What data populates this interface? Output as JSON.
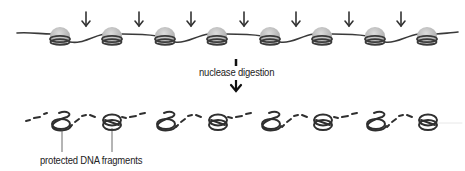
{
  "diagram": {
    "top_row": {
      "description": "chromatin fiber: DNA wrapped around nucleosomes",
      "nucleosome_count": 8,
      "nucleosome_x": [
        60,
        112,
        165,
        217,
        270,
        322,
        375,
        427
      ],
      "cut_arrow_x": [
        86,
        139,
        191,
        244,
        296,
        349,
        401
      ],
      "colors": {
        "histone": "#c2c2c2",
        "histone_highlight": "#d9d9d9",
        "dna": "#3a3a3a"
      }
    },
    "process": {
      "label": "nuclease digestion",
      "arrow": "down-arrow"
    },
    "bottom_row": {
      "description": "digested DNA: protected coiled fragments with degraded linker",
      "fragment_x": [
        60,
        112,
        165,
        217,
        270,
        322,
        375,
        427
      ],
      "label": "protected DNA fragments",
      "callout_targets_x": [
        62,
        112
      ]
    }
  }
}
